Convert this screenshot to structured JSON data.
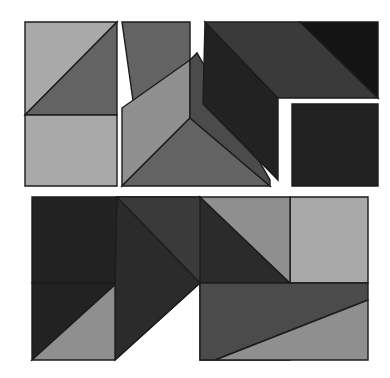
{
  "canvas": {
    "width": 390,
    "height": 378,
    "background": "#ffffff",
    "title": "Geometric tangram-style tile puzzle"
  },
  "palette": {
    "light_gray": "#a9a9a9",
    "mid_gray": "#8f8f8f",
    "medium_gray": "#636363",
    "dark_medium_gray": "#4b4b4b",
    "dark_gray": "#3a3a3a",
    "near_black": "#222222",
    "black": "#141414",
    "outline": "#1c1c1c",
    "gap": "#ffffff"
  },
  "groups": [
    {
      "name": "top-left-piece",
      "label": "Top left square piece",
      "pieces": [
        {
          "name": "light-upper-left-triangle",
          "points": "25,22 25,115 117,22",
          "fill": "#a9a9a9"
        },
        {
          "name": "medium-upper-right-band",
          "points": "25,115 117,22 117,115",
          "fill": "#636363"
        },
        {
          "name": "light-lower-square",
          "points": "25,115 117,115 117,186 25,186",
          "fill": "#a9a9a9"
        }
      ]
    },
    {
      "name": "top-middle-piece",
      "label": "Top middle arrow piece",
      "pieces": [
        {
          "name": "medium-upper-wedge",
          "points": "122,22 190,22 190,60 135,115",
          "fill": "#636363"
        },
        {
          "name": "light-left-parallelogram",
          "points": "122,108 190,60 190,118 122,186",
          "fill": "#8f8f8f"
        },
        {
          "name": "medium-lower-triangle",
          "points": "122,186 190,118 270,186",
          "fill": "#636363"
        },
        {
          "name": "dark-right-wedge",
          "points": "190,60 197,53 270,180 270,186 190,118",
          "fill": "#4b4b4b"
        }
      ]
    },
    {
      "name": "top-right-piece",
      "label": "Top right corner piece",
      "pieces": [
        {
          "name": "black-left-chevron",
          "points": "205,22 278,98 278,180 203,104",
          "fill": "#222222"
        },
        {
          "name": "dark-diagonal-band",
          "points": "205,22 300,22 378,98 278,98",
          "fill": "#3a3a3a"
        },
        {
          "name": "black-upper-right-triangle",
          "points": "300,22 378,22 378,98",
          "fill": "#141414"
        }
      ]
    },
    {
      "name": "top-right-square-piece",
      "label": "Top right lower black square",
      "pieces": [
        {
          "name": "black-square",
          "points": "292,104 378,104 378,186 292,186",
          "fill": "#222222"
        }
      ]
    },
    {
      "name": "bottom-rectangle-piece",
      "label": "Bottom large rectangle composition",
      "pieces": [
        {
          "name": "black-top-left-square",
          "points": "32,197 117,197 117,283 32,283",
          "fill": "#222222"
        },
        {
          "name": "black-left-triangle",
          "points": "32,283 117,283 32,360",
          "fill": "#222222"
        },
        {
          "name": "light-lower-left-band",
          "points": "32,360 117,283 200,283 115,360",
          "fill": "#8f8f8f"
        },
        {
          "name": "black-center-chevron-left",
          "points": "117,197 200,197 200,283 115,360 115,283",
          "fill": "#2b2b2b"
        },
        {
          "name": "dark-center-top-wedge",
          "points": "117,197 200,197 290,283 200,283",
          "fill": "#3a3a3a"
        },
        {
          "name": "black-center-peak",
          "points": "200,197 290,283 200,283",
          "fill": "#2b2b2b"
        },
        {
          "name": "light-center-parallelogram",
          "points": "200,283 290,283 290,360 200,360",
          "fill": "#8f8f8f"
        },
        {
          "name": "light-right-upper-block",
          "points": "290,197 368,197 368,283 290,283",
          "fill": "#a9a9a9"
        },
        {
          "name": "light-upper-right-wedge",
          "points": "200,197 290,197 290,283",
          "fill": "#8f8f8f"
        },
        {
          "name": "dark-lower-right-band",
          "points": "200,283 368,283 368,300 215,360 200,360",
          "fill": "#4b4b4b"
        },
        {
          "name": "light-bottom-right-triangle",
          "points": "368,300 368,360 215,360",
          "fill": "#8f8f8f"
        }
      ]
    }
  ]
}
